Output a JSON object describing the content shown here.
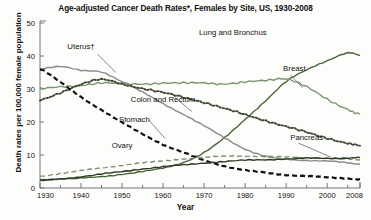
{
  "chart_data": {
    "type": "line",
    "title": "Age-adjusted Cancer Death Rates*, Females by Site, US, 1930-2008",
    "xlabel": "Year",
    "ylabel": "Death rates per 100,000 female population",
    "xlim": [
      1930,
      2008
    ],
    "ylim": [
      0,
      50
    ],
    "ytick_labels": [
      "0",
      "10",
      "20",
      "30",
      "40",
      "50"
    ],
    "ytick_values": [
      0,
      10,
      20,
      30,
      40,
      50
    ],
    "xtick_labels": [
      "1930",
      "1940",
      "1950",
      "1960",
      "1970",
      "1980",
      "1990",
      "2000",
      "2008"
    ],
    "xtick_values": [
      1930,
      1940,
      1950,
      1960,
      1970,
      1980,
      1990,
      2000,
      2008
    ],
    "xminor_values": [
      1935,
      1945,
      1955,
      1965,
      1975,
      1985,
      1995,
      2005
    ],
    "grid": false,
    "legend_position": "inline-annotations",
    "x": [
      1930,
      1935,
      1940,
      1945,
      1950,
      1955,
      1960,
      1965,
      1970,
      1975,
      1980,
      1985,
      1990,
      1995,
      2000,
      2005,
      2008
    ],
    "series": [
      {
        "name": "Lung and Bronchus",
        "color": "#4a6639",
        "style": "solid",
        "label_x": 1977,
        "label_y": 46.5,
        "values": [
          2.5,
          2.8,
          3.0,
          3.4,
          4.2,
          5.0,
          6.0,
          7.8,
          10.8,
          15.2,
          20.8,
          26.5,
          32.2,
          35.8,
          38.6,
          40.9,
          40.2
        ]
      },
      {
        "name": "Breast",
        "color": "#7d9470",
        "style": "solid",
        "label_x": 1992,
        "label_y": 35.5,
        "values": [
          30.0,
          30.6,
          31.2,
          31.8,
          31.5,
          31.6,
          31.8,
          31.7,
          31.9,
          31.6,
          32.0,
          32.6,
          33.2,
          30.6,
          26.8,
          24.0,
          22.4
        ]
      },
      {
        "name": "Uterus",
        "color": "#8a8a8a",
        "style": "solid",
        "label_x": 1940,
        "label_y": 42.0,
        "values": [
          36.2,
          36.8,
          35.6,
          35.2,
          32.2,
          29.0,
          25.6,
          22.3,
          18.8,
          15.2,
          11.8,
          9.6,
          8.7,
          8.4,
          8.2,
          7.6,
          7.2
        ]
      },
      {
        "name": "Colon and Rectum",
        "color": "#3d4a33",
        "style": "dotted",
        "label_x": 1960,
        "label_y": 26.0,
        "values": [
          26.6,
          29.0,
          31.4,
          32.8,
          31.6,
          30.2,
          28.8,
          27.5,
          26.0,
          24.0,
          22.2,
          20.5,
          18.6,
          16.8,
          15.2,
          13.6,
          12.8
        ]
      },
      {
        "name": "Stomach",
        "color": "#111111",
        "style": "dashed",
        "label_x": 1953,
        "label_y": 20.0,
        "values": [
          36.0,
          32.0,
          27.6,
          23.6,
          19.8,
          16.4,
          13.2,
          10.7,
          8.4,
          6.6,
          5.4,
          4.6,
          4.0,
          3.6,
          3.2,
          2.9,
          2.7
        ]
      },
      {
        "name": "Ovary",
        "color": "#7d9470",
        "style": "dashed",
        "label_x": 1950,
        "label_y": 12.0,
        "values": [
          3.6,
          4.4,
          5.2,
          6.1,
          6.9,
          7.6,
          8.2,
          8.8,
          9.3,
          9.6,
          9.7,
          9.5,
          9.4,
          9.2,
          9.0,
          8.7,
          8.5
        ]
      },
      {
        "name": "Pancreas",
        "color": "#2e3a26",
        "style": "solid",
        "label_x": 1995,
        "label_y": 14.5,
        "values": [
          2.2,
          2.8,
          3.4,
          4.2,
          5.0,
          5.8,
          6.4,
          7.0,
          7.6,
          8.0,
          8.4,
          8.6,
          8.8,
          9.0,
          9.0,
          9.1,
          9.2
        ]
      }
    ]
  }
}
